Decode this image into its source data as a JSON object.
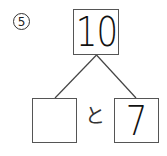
{
  "problem": {
    "number": "⑤",
    "number_value": "5",
    "whole": "10",
    "part_left": "",
    "connector_text": "と",
    "part_right": "7"
  },
  "colors": {
    "box_border": "#555555",
    "line": "#444444",
    "text": "#111111"
  }
}
